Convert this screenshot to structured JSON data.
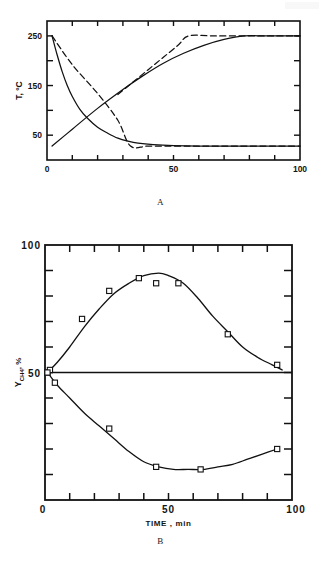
{
  "figure": {
    "panel_label_a": "A",
    "panel_label_b": "B"
  },
  "chart_data": [
    {
      "type": "line",
      "id": "panel-a",
      "title": "",
      "xlabel": "",
      "ylabel": "T, °C",
      "xlim": [
        0,
        100
      ],
      "ylim": [
        0,
        280
      ],
      "grid": false,
      "legend_position": "none",
      "xticks_labeled": [
        0,
        50,
        100
      ],
      "xtick_labels": [
        "0",
        "50",
        "100"
      ],
      "xticks_minor": [
        10,
        20,
        30,
        40,
        60,
        70,
        80,
        90
      ],
      "yticks_labeled": [
        50,
        150,
        250
      ],
      "ytick_labels": [
        "50",
        "150",
        "250"
      ],
      "yticks_minor": [
        100,
        200
      ],
      "series": [
        {
          "name": "solid-decay",
          "style": "solid",
          "x": [
            2,
            4,
            6,
            8,
            10,
            13,
            16,
            20,
            24,
            28,
            32,
            36,
            42,
            50,
            60,
            75,
            90,
            100
          ],
          "y": [
            250,
            212,
            178,
            150,
            128,
            102,
            84,
            66,
            54,
            44,
            38,
            34,
            31,
            29,
            28,
            28,
            28,
            28
          ]
        },
        {
          "name": "dashed-decay",
          "style": "dashed",
          "x": [
            2,
            10,
            20,
            28,
            33,
            40,
            52,
            62,
            75,
            90,
            100
          ],
          "y": [
            250,
            192,
            134,
            80,
            28,
            28,
            28,
            28,
            28,
            28,
            28
          ]
        },
        {
          "name": "solid-rise",
          "style": "solid",
          "x": [
            2,
            10,
            20,
            30,
            38,
            46,
            54,
            62,
            70,
            78,
            86,
            94,
            100
          ],
          "y": [
            28,
            62,
            104,
            142,
            170,
            195,
            215,
            231,
            243,
            250,
            250,
            250,
            250
          ]
        },
        {
          "name": "dashed-rise",
          "style": "dashed",
          "x": [
            28,
            34,
            40,
            46,
            52,
            56,
            66,
            78,
            90,
            100
          ],
          "y": [
            132,
            157,
            182,
            207,
            232,
            250,
            250,
            250,
            250,
            250
          ]
        }
      ]
    },
    {
      "type": "scatter",
      "id": "panel-b",
      "title": "",
      "xlabel": "TIME , min",
      "ylabel": "Y CH4 , %",
      "ylabel_main": "Y",
      "ylabel_sub": "CH",
      "ylabel_sub2": "4",
      "ylabel_unit": ", %",
      "xlim": [
        0,
        100
      ],
      "ylim": [
        0,
        100
      ],
      "grid": false,
      "legend_position": "none",
      "xticks_labeled": [
        0,
        50,
        100
      ],
      "xtick_labels": [
        "0",
        "50",
        "100"
      ],
      "xticks_minor": [
        10,
        20,
        30,
        40,
        60,
        70,
        80,
        90
      ],
      "yticks_labeled": [
        50,
        100
      ],
      "ytick_labels": [
        "50",
        "100"
      ],
      "yticks_minor": [
        10,
        20,
        30,
        40,
        60,
        70,
        80,
        90
      ],
      "reference_line_y": 50,
      "series": [
        {
          "name": "upper-branch-markers",
          "marker": "square-open",
          "x": [
            1,
            2,
            15,
            26,
            38,
            45,
            54,
            74,
            94
          ],
          "y": [
            50,
            51,
            71,
            82,
            87,
            85,
            85,
            65,
            53
          ]
        },
        {
          "name": "upper-branch-fit",
          "style": "solid",
          "x": [
            1,
            5,
            10,
            16,
            22,
            28,
            34,
            40,
            46,
            50,
            56,
            62,
            68,
            74,
            80,
            86,
            92,
            96
          ],
          "y": [
            50,
            54,
            60,
            68,
            75,
            81,
            85,
            88,
            89,
            88,
            85,
            79,
            72,
            66,
            60,
            56,
            53,
            51
          ]
        },
        {
          "name": "lower-branch-markers",
          "marker": "square-open",
          "x": [
            1,
            4,
            26,
            45,
            63,
            94
          ],
          "y": [
            50,
            46,
            28,
            13,
            12,
            20
          ]
        },
        {
          "name": "lower-branch-fit",
          "style": "solid",
          "x": [
            1,
            5,
            10,
            16,
            22,
            28,
            34,
            40,
            46,
            52,
            58,
            64,
            70,
            76,
            82,
            88,
            94
          ],
          "y": [
            50,
            45,
            40,
            34,
            29,
            24,
            19,
            15,
            13,
            12,
            12,
            12,
            13,
            14,
            16,
            18,
            20
          ]
        }
      ]
    }
  ]
}
